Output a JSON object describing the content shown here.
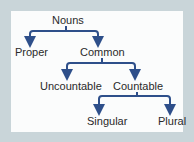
{
  "diagram": {
    "type": "tree",
    "colors": {
      "frame": "#c9d5d9",
      "panel": "#fbfcfc",
      "connector": "#2e4f8a",
      "text": "#2a2a2a"
    },
    "nodes": {
      "root": "Nouns",
      "proper": "Proper",
      "common": "Common",
      "uncountable": "Uncountable",
      "countable": "Countable",
      "singular": "Singular",
      "plural": "Plural"
    },
    "edges": [
      [
        "Nouns",
        "Proper"
      ],
      [
        "Nouns",
        "Common"
      ],
      [
        "Common",
        "Uncountable"
      ],
      [
        "Common",
        "Countable"
      ],
      [
        "Countable",
        "Singular"
      ],
      [
        "Countable",
        "Plural"
      ]
    ]
  }
}
